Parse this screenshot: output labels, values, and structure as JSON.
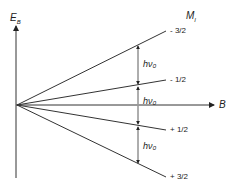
{
  "diagram": {
    "y_axis_label": "E",
    "y_axis_subscript": "B",
    "x_axis_label": "B",
    "column_header": "M",
    "column_header_subscript": "I",
    "levels": [
      {
        "label": "- 3/2",
        "end_y": 31
      },
      {
        "label": "- 1/2",
        "end_y": 80
      },
      {
        "label": "+ 1/2",
        "end_y": 130
      },
      {
        "label": "+ 3/2",
        "end_y": 177
      }
    ],
    "splittings": [
      "hν₀",
      "hν₀",
      "hν₀"
    ]
  }
}
